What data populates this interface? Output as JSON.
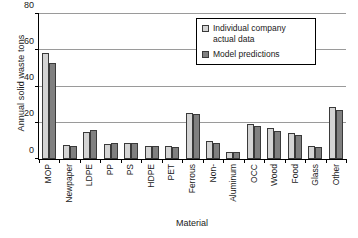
{
  "chart_data": {
    "type": "bar",
    "title": "",
    "xlabel": "Material",
    "ylabel": "Annual solid waste tons",
    "ylim": [
      0,
      80
    ],
    "yticks": [
      0,
      20,
      40,
      60,
      80
    ],
    "grid": "horizontal",
    "legend_position": "upper-right-inside",
    "categories": [
      "MOP",
      "Newpaper",
      "LDPE",
      "PP",
      "PS",
      "HDPE",
      "PET",
      "Ferrous",
      "Non-",
      "Aluminum",
      "OCC",
      "Wood",
      "Food",
      "Glass",
      "Other"
    ],
    "series": [
      {
        "name": "Individual company actual data",
        "color": "#d4d4d4",
        "values": [
          58.5,
          7.5,
          15.0,
          8.5,
          8.7,
          7.3,
          7.3,
          25.5,
          10.2,
          4.0,
          19.5,
          17.0,
          14.5,
          7.0,
          28.5
        ]
      },
      {
        "name": "Model predictions",
        "color": "#808080",
        "values": [
          53.0,
          7.0,
          15.8,
          8.6,
          8.6,
          7.0,
          6.9,
          25.0,
          8.6,
          4.0,
          18.0,
          15.5,
          13.5,
          6.5,
          27.0
        ]
      }
    ]
  },
  "legend": {
    "items": [
      {
        "label": "Individual company actual data",
        "swatch": "light-gray-swatch"
      },
      {
        "label": "Model predictions",
        "swatch": "dark-gray-swatch"
      }
    ]
  }
}
